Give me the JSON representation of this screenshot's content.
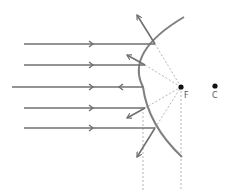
{
  "diagram": {
    "type": "convex-mirror-ray-diagram",
    "colors": {
      "ray": "#707070",
      "mirror": "#808080",
      "dotted": "#b0b0b0",
      "point": "#111111"
    },
    "points": {
      "focus": {
        "label": "F",
        "x": 181,
        "y": 87
      },
      "center": {
        "label": "C",
        "x": 215,
        "y": 87
      }
    },
    "incident_rays": [
      {
        "y": 44,
        "x_start": 24,
        "x_end": 155
      },
      {
        "y": 65,
        "x_start": 24,
        "x_end": 145
      },
      {
        "y": 87,
        "x_start": 12,
        "x_end": 143
      },
      {
        "y": 108,
        "x_start": 24,
        "x_end": 145
      },
      {
        "y": 128,
        "x_start": 24,
        "x_end": 155
      }
    ],
    "reflected_rays": [
      {
        "from": [
          155,
          44
        ],
        "to": [
          136,
          14
        ]
      },
      {
        "from": [
          145,
          65
        ],
        "to": [
          126,
          54
        ]
      },
      {
        "from": [
          143,
          87
        ],
        "to": [
          118,
          87
        ]
      },
      {
        "from": [
          145,
          108
        ],
        "to": [
          126,
          119
        ]
      },
      {
        "from": [
          155,
          128
        ],
        "to": [
          136,
          158
        ]
      }
    ]
  }
}
